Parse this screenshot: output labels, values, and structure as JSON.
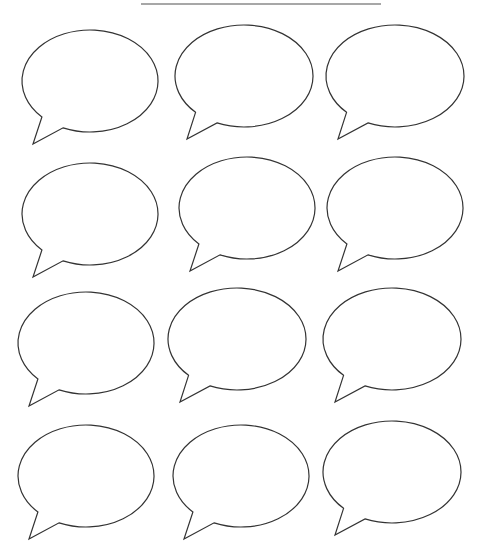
{
  "page": {
    "background": "#ffffff",
    "stroke_color": "#333333",
    "rule_color": "#8a8a8a"
  },
  "header_rule": {
    "x1": 141,
    "x2": 381,
    "y": 4
  },
  "bubbles": [
    {
      "id": 1,
      "cx": 90,
      "cy": 81,
      "rx": 68,
      "ry": 51
    },
    {
      "id": 2,
      "cx": 244,
      "cy": 76,
      "rx": 69,
      "ry": 51
    },
    {
      "id": 3,
      "cx": 395,
      "cy": 76,
      "rx": 69,
      "ry": 51
    },
    {
      "id": 4,
      "cx": 90,
      "cy": 214,
      "rx": 68,
      "ry": 51
    },
    {
      "id": 5,
      "cx": 247,
      "cy": 208,
      "rx": 68,
      "ry": 51
    },
    {
      "id": 6,
      "cx": 395,
      "cy": 208,
      "rx": 68,
      "ry": 51
    },
    {
      "id": 7,
      "cx": 86,
      "cy": 343,
      "rx": 68,
      "ry": 51
    },
    {
      "id": 8,
      "cx": 237,
      "cy": 339,
      "rx": 69,
      "ry": 51
    },
    {
      "id": 9,
      "cx": 392,
      "cy": 339,
      "rx": 69,
      "ry": 51
    },
    {
      "id": 10,
      "cx": 86,
      "cy": 476,
      "rx": 68,
      "ry": 51
    },
    {
      "id": 11,
      "cx": 241,
      "cy": 476,
      "rx": 68,
      "ry": 51
    },
    {
      "id": 12,
      "cx": 392,
      "cy": 472,
      "rx": 69,
      "ry": 51
    }
  ],
  "tail": {
    "left_joint": [
      -48,
      36
    ],
    "tip": [
      -57,
      63
    ],
    "right_joint": [
      -27,
      47
    ]
  }
}
